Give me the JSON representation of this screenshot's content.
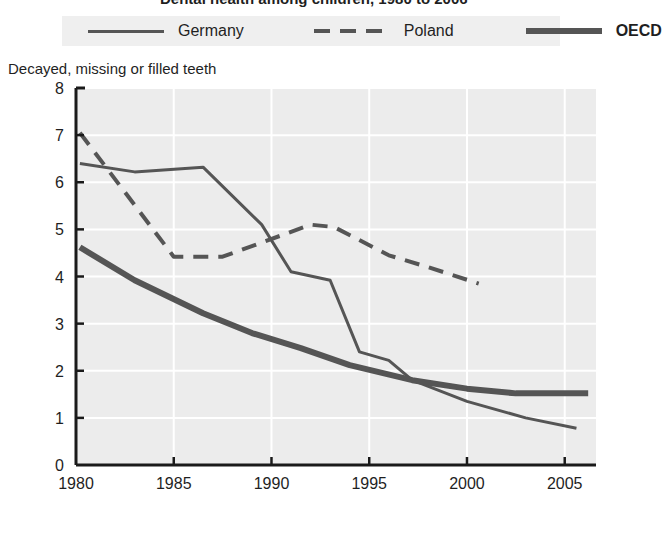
{
  "title": {
    "text": "Dental health among children, 1980 to 2006"
  },
  "legend": {
    "position": "top",
    "items": [
      {
        "label": "Germany",
        "style": "solid-thin",
        "swatch": "thin",
        "bold": false,
        "color": "#555555"
      },
      {
        "label": "Poland",
        "style": "dashed",
        "swatch": "dashed",
        "bold": false,
        "color": "#555555"
      },
      {
        "label": "OECD",
        "style": "solid-thick",
        "swatch": "thick",
        "bold": true,
        "color": "#555555"
      }
    ]
  },
  "axis_caption": "Decayed, missing or filled teeth",
  "y_axis": {
    "ticks": [
      "0",
      "1",
      "2",
      "3",
      "4",
      "5",
      "6",
      "7",
      "8"
    ],
    "min": 0,
    "max": 8
  },
  "x_axis": {
    "ticks": [
      "1980",
      "1985",
      "1990",
      "1995",
      "2000",
      "2005"
    ],
    "min": 1980,
    "max": 2006.6
  },
  "colors": {
    "plot_background": "#ececec",
    "gridline": "#ffffff",
    "axis": "#1a1a1a",
    "line": "#555555",
    "text": "#1f1f1f",
    "legend_background": "#efefef"
  },
  "chart_data": {
    "type": "line",
    "title": "Dental health among children, 1980 to 2006",
    "xlabel": "",
    "ylabel": "Decayed, missing or filled teeth",
    "xlim": [
      1980,
      2006.6
    ],
    "ylim": [
      0,
      8
    ],
    "grid": true,
    "legend_position": "top",
    "series": [
      {
        "name": "Germany",
        "style": "solid-thin",
        "points": [
          [
            1980.2,
            6.4
          ],
          [
            1983.0,
            6.22
          ],
          [
            1986.5,
            6.32
          ],
          [
            1989.5,
            5.1
          ],
          [
            1991.0,
            4.1
          ],
          [
            1993.0,
            3.92
          ],
          [
            1994.5,
            2.4
          ],
          [
            1996.0,
            2.22
          ],
          [
            1997.2,
            1.8
          ],
          [
            2000.0,
            1.35
          ],
          [
            2003.0,
            1.0
          ],
          [
            2005.6,
            0.78
          ]
        ]
      },
      {
        "name": "Poland",
        "style": "dashed",
        "points": [
          [
            1980.2,
            7.05
          ],
          [
            1985.0,
            4.42
          ],
          [
            1987.5,
            4.42
          ],
          [
            1989.5,
            4.72
          ],
          [
            1992.0,
            5.1
          ],
          [
            1993.2,
            5.05
          ],
          [
            1996.0,
            4.45
          ],
          [
            1998.0,
            4.2
          ],
          [
            2000.6,
            3.85
          ]
        ]
      },
      {
        "name": "OECD",
        "style": "solid-thick",
        "points": [
          [
            1980.2,
            4.62
          ],
          [
            1983.0,
            3.92
          ],
          [
            1986.5,
            3.22
          ],
          [
            1989.0,
            2.8
          ],
          [
            1991.5,
            2.48
          ],
          [
            1994.0,
            2.12
          ],
          [
            1997.2,
            1.8
          ],
          [
            2000.0,
            1.62
          ],
          [
            2002.5,
            1.52
          ],
          [
            2006.2,
            1.52
          ]
        ]
      }
    ]
  }
}
